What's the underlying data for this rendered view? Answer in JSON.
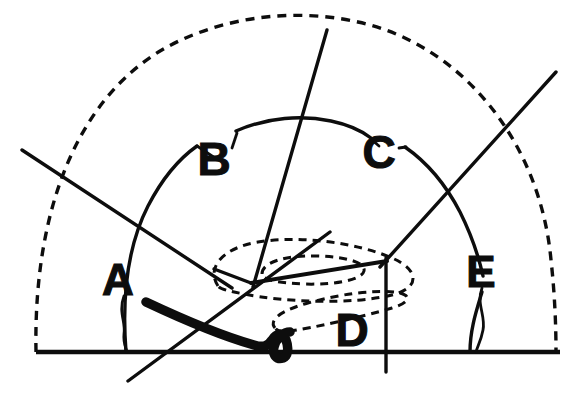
{
  "figure": {
    "background_color": "#ffffff",
    "ink_color": "#0d0d0d",
    "width": 587,
    "height": 396
  },
  "labels": [
    {
      "id": "label-a",
      "text": "A",
      "x": 118,
      "y": 283,
      "font_size": 44
    },
    {
      "id": "label-b",
      "text": "B",
      "x": 214,
      "y": 163,
      "font_size": 46
    },
    {
      "id": "label-c",
      "text": "C",
      "x": 379,
      "y": 156,
      "font_size": 46
    },
    {
      "id": "label-d",
      "text": "D",
      "x": 352,
      "y": 334,
      "font_size": 46
    },
    {
      "id": "label-e",
      "text": "E",
      "x": 481,
      "y": 275,
      "font_size": 44
    }
  ],
  "strokes": {
    "baseline": {
      "name": "baseline",
      "d": "M 36 352 L 560 352",
      "width": 4.6,
      "style": "solid"
    },
    "outer_dashed_arc": {
      "name": "outer-dashed-arc",
      "d": "M 36 352 C 33 200 84 84 181 40 C 236 15 300 9 358 22 C 460 44 540 140 551 260 C 555 296 556 328 556 352",
      "width": 3.4,
      "style": "dashed",
      "dash": "9 7"
    },
    "inner_solid_arc": {
      "name": "inner-solid-arc",
      "segments": [
        {
          "name": "inner-arc-left",
          "d": "M 126 352 C 122 300 126 249 148 206 C 163 177 180 158 197 146"
        },
        {
          "name": "inner-arc-mid",
          "d": "M 236 131 C 268 117 302 115 331 121 C 350 125 362 131 371 138"
        },
        {
          "name": "inner-arc-right",
          "d": "M 405 147 C 428 163 446 185 460 212 C 472 236 479 258 483 276"
        },
        {
          "name": "inner-arc-foot",
          "d": "M 482 292 C 476 312 470 330 470 352"
        }
      ],
      "width": 3.4,
      "style": "solid"
    },
    "radial_lines": [
      {
        "name": "radial-line-upper-left",
        "d": "M 22 150 L 232 288",
        "width": 3.4
      },
      {
        "name": "radial-line-lower-left",
        "d": "M 128 381 L 330 232",
        "width": 3.4
      },
      {
        "name": "radial-line-steep",
        "d": "M 327 30 L 253 287",
        "width": 3.4
      },
      {
        "name": "radial-line-upper-right",
        "d": "M 556 72 L 380 267",
        "width": 3.4
      },
      {
        "name": "radial-line-vertical-right",
        "d": "M 386 258 L 386 372",
        "width": 3.4
      },
      {
        "name": "node-connector",
        "d": "M 251 283 L 387 261",
        "width": 4.0
      },
      {
        "name": "node-spur-left",
        "d": "M 251 283 L 214 269",
        "width": 3.4
      }
    ],
    "dashed_ellipses": [
      {
        "name": "dashed-ellipse-outer",
        "d": "M 218 286 C 206 268 222 248 258 242 C 300 235 358 243 392 258 C 420 270 420 288 392 295 C 352 305 282 302 244 294 C 228 291 220 289 218 286 Z",
        "width": 3.0,
        "dash": "8 6"
      },
      {
        "name": "dashed-ellipse-inner",
        "d": "M 262 274 C 262 262 286 255 318 256 C 348 257 366 263 364 271 C 362 280 334 285 304 284 C 278 283 262 280 262 274 Z",
        "width": 3.0,
        "dash": "8 6"
      },
      {
        "name": "dashed-ellipse-lower",
        "d": "M 275 328 C 268 320 282 310 308 303 C 340 294 372 290 394 292 C 412 294 412 302 392 308 C 358 318 312 328 290 331 C 280 332 277 331 275 328 Z",
        "width": 3.0,
        "dash": "8 6"
      }
    ],
    "bold_curve": {
      "name": "bold-squiggle-curve",
      "d": "M 146 302 C 180 318 222 336 254 345 C 264 348 268 346 272 340 C 276 333 283 332 286 340 C 289 348 288 356 283 358 C 277 360 272 355 274 347 C 276 338 284 332 290 332",
      "width": 9.5,
      "style": "solid"
    },
    "leader_lines": [
      {
        "name": "leader-a",
        "d": "M 124 296 C 118 312 126 322 124 334 C 123 343 126 348 127 352",
        "width": 2.8
      },
      {
        "name": "leader-b",
        "d": "M 197 146 L 215 158",
        "width": 2.8
      },
      {
        "name": "leader-b-right",
        "d": "M 232 148 L 237 133",
        "width": 2.8
      },
      {
        "name": "leader-c-left",
        "d": "M 371 139 L 379 146",
        "width": 2.8
      },
      {
        "name": "leader-c-right",
        "d": "M 399 148 L 406 147",
        "width": 2.8
      },
      {
        "name": "leader-e",
        "d": "M 482 288 C 476 304 486 316 483 330 C 481 341 477 347 476 352",
        "width": 2.8
      }
    ]
  }
}
